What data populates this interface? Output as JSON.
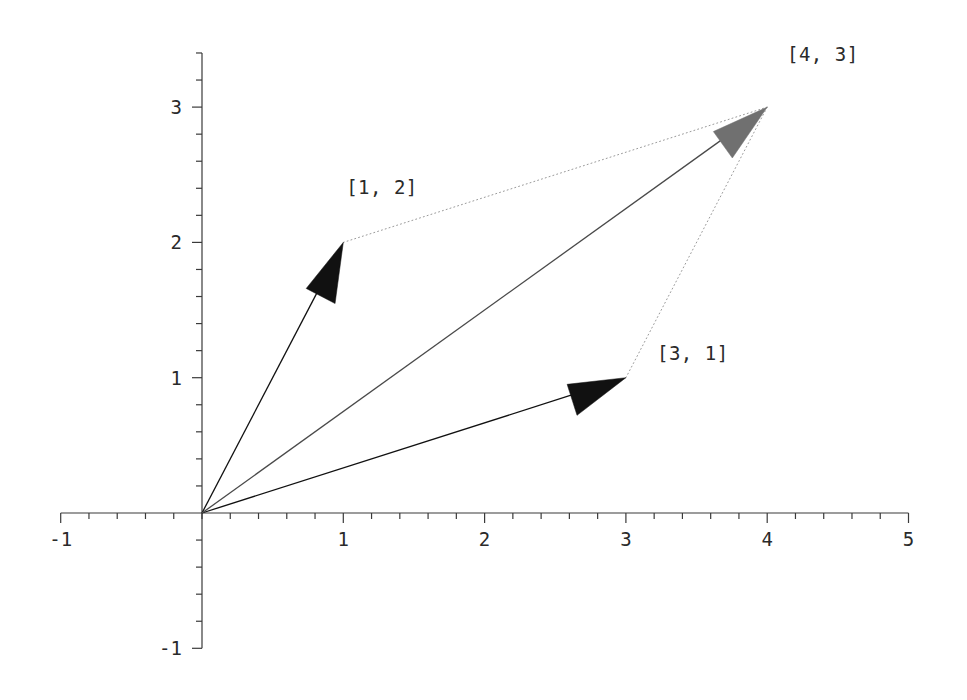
{
  "figure": {
    "width": 967,
    "height": 700,
    "background": "#ffffff"
  },
  "chart_data": {
    "type": "scatter",
    "title": "",
    "xlabel": "",
    "ylabel": "",
    "xlim": [
      -1,
      5
    ],
    "ylim": [
      -1,
      3.4
    ],
    "grid": false,
    "legend": null,
    "axes": {
      "x_ticks_major": [
        -1,
        1,
        2,
        3,
        4,
        5
      ],
      "x_tick_labels": [
        "-1",
        "1",
        "2",
        "3",
        "4",
        "5"
      ],
      "x_minor_step": 0.2,
      "y_ticks_major": [
        -1,
        1,
        2,
        3
      ],
      "y_tick_labels": [
        "-1",
        "1",
        "2",
        "3"
      ],
      "y_minor_step": 0.2,
      "origin_label": ""
    },
    "vectors": [
      {
        "name": "vector-a",
        "label": "[1, 2]",
        "tail": [
          0,
          0
        ],
        "head": [
          1,
          2
        ],
        "x": 1,
        "y": 2,
        "color": "#111111",
        "head_fill": "#111111",
        "style": "solid",
        "label_pos": [
          1.02,
          2.36
        ]
      },
      {
        "name": "vector-b",
        "label": "[3, 1]",
        "tail": [
          0,
          0
        ],
        "head": [
          3,
          1
        ],
        "x": 3,
        "y": 1,
        "color": "#111111",
        "head_fill": "#111111",
        "style": "solid",
        "label_pos": [
          3.22,
          1.13
        ]
      },
      {
        "name": "vector-sum",
        "label": "[4, 3]",
        "tail": [
          0,
          0
        ],
        "head": [
          4,
          3
        ],
        "x": 4,
        "y": 3,
        "color": "#4a4a4a",
        "head_fill": "#707070",
        "style": "solid",
        "label_pos": [
          4.14,
          3.34
        ]
      }
    ],
    "construction_lines": [
      {
        "name": "dotted-a-to-sum",
        "from": [
          1,
          2
        ],
        "to": [
          4,
          3
        ],
        "style": "dotted",
        "color": "#9a9a9a"
      },
      {
        "name": "dotted-b-to-sum",
        "from": [
          3,
          1
        ],
        "to": [
          4,
          3
        ],
        "style": "dotted",
        "color": "#9a9a9a"
      }
    ],
    "annotations": [
      {
        "text": "[1, 2]",
        "x": 1.02,
        "y": 2.36
      },
      {
        "text": "[3, 1]",
        "x": 3.22,
        "y": 1.13
      },
      {
        "text": "[4, 3]",
        "x": 4.14,
        "y": 3.34
      }
    ]
  }
}
